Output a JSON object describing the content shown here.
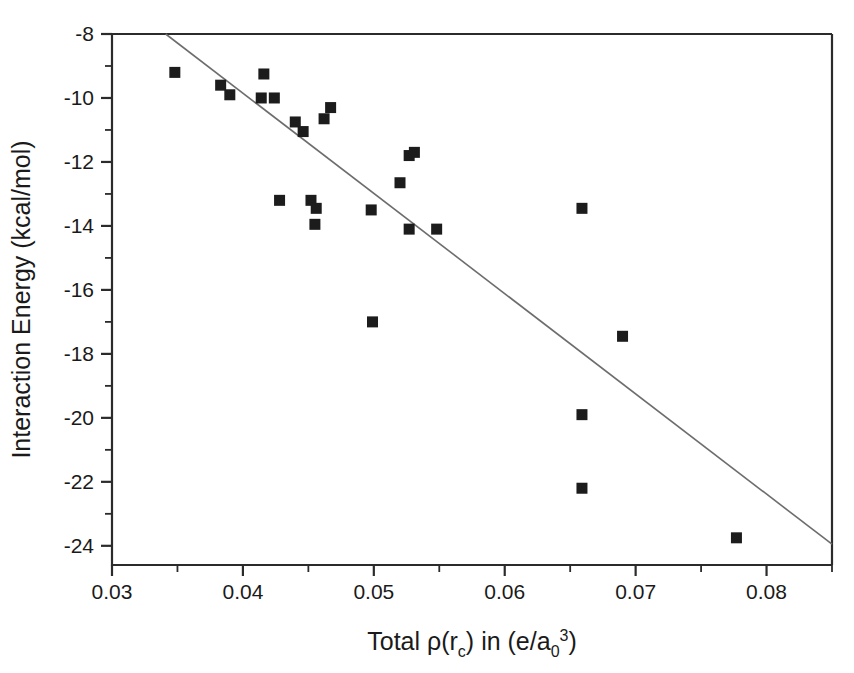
{
  "chart_data": {
    "type": "scatter",
    "title": "",
    "xlabel": "Total ρ(r_c) in (e/a_0^3)",
    "xlabel_parts": {
      "prefix": "Total ",
      "rho": "ρ",
      "open": "(r",
      "sub_c": "c",
      "close": ")",
      "middle": " in (e/a",
      "sub_0": "0",
      "sup_3": "3",
      "tail": ")"
    },
    "ylabel": "Interaction Energy (kcal/mol)",
    "xlim": [
      0.03,
      0.085
    ],
    "ylim": [
      -24.6,
      -8.0
    ],
    "grid": false,
    "legend": "none",
    "x_ticks": [
      0.03,
      0.04,
      0.05,
      0.06,
      0.07,
      0.08
    ],
    "x_tick_labels": [
      "0.03",
      "0.04",
      "0.05",
      "0.06",
      "0.07",
      "0.08"
    ],
    "x_minor_ticks": [
      0.035,
      0.045,
      0.055,
      0.065,
      0.075,
      0.085
    ],
    "y_ticks": [
      -8,
      -10,
      -12,
      -14,
      -16,
      -18,
      -20,
      -22,
      -24
    ],
    "y_tick_labels": [
      "-8",
      "-10",
      "-12",
      "-14",
      "-16",
      "-18",
      "-20",
      "-22",
      "-24"
    ],
    "y_minor_ticks": [
      -9,
      -11,
      -13,
      -15,
      -17,
      -19,
      -21,
      -23
    ],
    "marker_shape": "square",
    "marker_color": "#1c1c1c",
    "marker_size": 11,
    "points": [
      {
        "x": 0.0348,
        "y": -9.2
      },
      {
        "x": 0.0383,
        "y": -9.6
      },
      {
        "x": 0.039,
        "y": -9.9
      },
      {
        "x": 0.0416,
        "y": -9.25
      },
      {
        "x": 0.0414,
        "y": -10.0
      },
      {
        "x": 0.0424,
        "y": -10.0
      },
      {
        "x": 0.044,
        "y": -10.75
      },
      {
        "x": 0.0446,
        "y": -11.05
      },
      {
        "x": 0.0462,
        "y": -10.65
      },
      {
        "x": 0.0467,
        "y": -10.3
      },
      {
        "x": 0.0428,
        "y": -13.2
      },
      {
        "x": 0.0452,
        "y": -13.2
      },
      {
        "x": 0.0456,
        "y": -13.45
      },
      {
        "x": 0.0455,
        "y": -13.95
      },
      {
        "x": 0.0498,
        "y": -13.5
      },
      {
        "x": 0.052,
        "y": -12.65
      },
      {
        "x": 0.0527,
        "y": -11.8
      },
      {
        "x": 0.0531,
        "y": -11.7
      },
      {
        "x": 0.0527,
        "y": -14.1
      },
      {
        "x": 0.0548,
        "y": -14.1
      },
      {
        "x": 0.0499,
        "y": -17.0
      },
      {
        "x": 0.0659,
        "y": -13.45
      },
      {
        "x": 0.069,
        "y": -17.45
      },
      {
        "x": 0.0659,
        "y": -19.9
      },
      {
        "x": 0.0659,
        "y": -22.2
      },
      {
        "x": 0.0777,
        "y": -23.75
      }
    ],
    "fit_line": {
      "label": "linear fit",
      "color": "#6d6d6d",
      "x_start": 0.0341,
      "y_start": -8.0,
      "x_end": 0.085,
      "y_end": -23.95
    }
  },
  "axes_geometry": {
    "left_px": 112,
    "right_px": 832,
    "top_px": 34,
    "bottom_px": 565
  }
}
